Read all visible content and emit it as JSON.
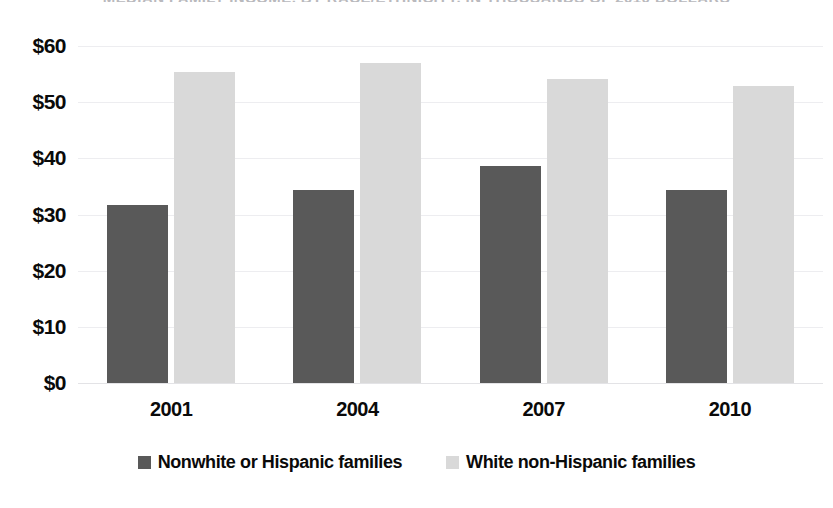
{
  "chart_data": {
    "type": "bar",
    "title": "MEDIAN FAMILY INCOME, BY RACE/ETHNICITY, IN THOUSANDS OF 2010 DOLLARS",
    "xlabel": "",
    "ylabel": "",
    "categories": [
      "2001",
      "2004",
      "2007",
      "2010"
    ],
    "series": [
      {
        "name": "Nonwhite or Hispanic families",
        "color": "#595959",
        "values": [
          31.7,
          34.4,
          38.6,
          34.4
        ]
      },
      {
        "name": "White non-Hispanic families",
        "color": "#d9d9d9",
        "values": [
          55.4,
          57.0,
          54.2,
          52.8
        ]
      }
    ],
    "ylim": [
      0,
      60
    ],
    "y_ticks": [
      0,
      10,
      20,
      30,
      40,
      50,
      60
    ],
    "y_tick_labels": [
      "$0",
      "$10",
      "$20",
      "$30",
      "$40",
      "$50",
      "$60"
    ],
    "grid": true,
    "legend_position": "bottom"
  },
  "colors": {
    "series_dark": "#595959",
    "series_light": "#d9d9d9",
    "gridline": "#ededf0",
    "text": "#0a0a0a",
    "background": "#ffffff"
  }
}
